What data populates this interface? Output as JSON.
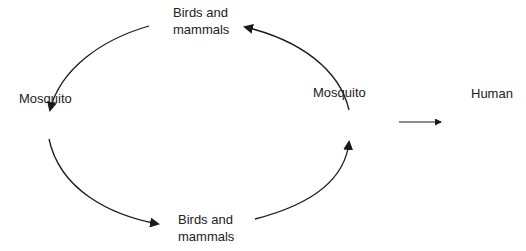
{
  "diagram": {
    "nodes": {
      "top": {
        "line1": "Birds and",
        "line2": "mammals"
      },
      "left": {
        "label": "Mosquito"
      },
      "right": {
        "label": "Mosquito"
      },
      "bottom": {
        "line1": "Birds and",
        "line2": "mammals"
      },
      "human": {
        "label": "Human"
      }
    },
    "edges": [
      {
        "from": "top",
        "to": "left"
      },
      {
        "from": "left",
        "to": "bottom"
      },
      {
        "from": "bottom",
        "to": "right"
      },
      {
        "from": "right",
        "to": "top"
      },
      {
        "from": "right",
        "to": "human"
      }
    ],
    "colors": {
      "stroke": "#1a1a1a",
      "text": "#222222",
      "background": "#ffffff"
    }
  }
}
